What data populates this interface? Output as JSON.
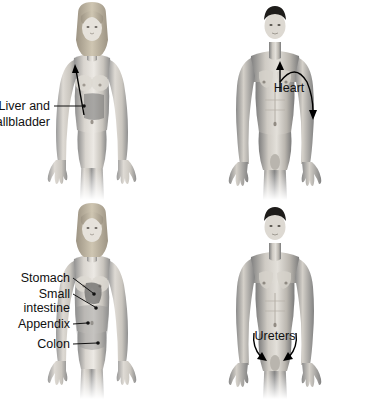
{
  "image": {
    "title": "Referred pain / organ location diagram",
    "background_color": "#ffffff",
    "width": 367,
    "height": 399,
    "text_color": "#111111",
    "panel_count": 4
  },
  "panels": [
    {
      "id": "top-left",
      "figure": "female-front-view",
      "hair_color": "#c9bda6",
      "labels": [
        {
          "name": "liver-gallbladder",
          "lines": [
            "Liver and",
            "gallbladder"
          ],
          "align": "right"
        }
      ],
      "organs": [
        {
          "name": "liver-and-gallbladder-region",
          "shade": "#6f6f6f"
        }
      ],
      "arrows": [
        {
          "name": "referred-pain-arrow",
          "direction": "up-left",
          "target": "right-shoulder"
        }
      ]
    },
    {
      "id": "top-right",
      "figure": "male-front-view",
      "hair_color": "#1e1c1a",
      "labels": [
        {
          "name": "heart",
          "lines": [
            "Heart"
          ],
          "align": "middle"
        }
      ],
      "organs": [],
      "arrows": [
        {
          "name": "heart-to-jaw-arrow",
          "direction": "up",
          "target": "neck-jaw"
        },
        {
          "name": "heart-to-arm-arrow",
          "direction": "curve-down",
          "target": "left-arm"
        }
      ]
    },
    {
      "id": "bottom-left",
      "figure": "female-front-view",
      "hair_color": "#c9bda6",
      "labels": [
        {
          "name": "stomach",
          "lines": [
            "Stomach"
          ],
          "align": "right"
        },
        {
          "name": "small-intestine",
          "lines": [
            "Small",
            "intestine"
          ],
          "align": "right"
        },
        {
          "name": "appendix",
          "lines": [
            "Appendix"
          ],
          "align": "right"
        },
        {
          "name": "colon",
          "lines": [
            "Colon"
          ],
          "align": "right"
        }
      ],
      "organs": [
        {
          "name": "stomach-region",
          "shade": "#4f4f4f"
        },
        {
          "name": "colon-intestine-region",
          "shade": "#8e8e8e"
        }
      ],
      "arrows": []
    },
    {
      "id": "bottom-right",
      "figure": "male-front-view",
      "hair_color": "#1e1c1a",
      "labels": [
        {
          "name": "ureters",
          "lines": [
            "Ureters"
          ],
          "align": "middle"
        }
      ],
      "organs": [],
      "arrows": [
        {
          "name": "ureter-left-arrow",
          "direction": "curve-down-right",
          "target": "groin"
        },
        {
          "name": "ureter-right-arrow",
          "direction": "curve-down-left",
          "target": "groin"
        }
      ]
    }
  ]
}
